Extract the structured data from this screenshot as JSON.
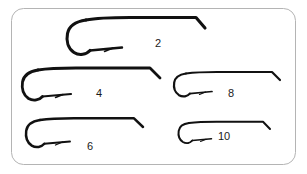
{
  "figure": {
    "type": "hook-size-chart",
    "background_color": "#ffffff",
    "panel": {
      "border_color": "#b4b4b4",
      "border_width": 1,
      "corner_radius": 12,
      "x": 11,
      "y": 8,
      "width": 285,
      "height": 157
    },
    "hook": {
      "stroke_color": "#111111",
      "description": "down-eye long-shank fly hook, bend at left, eye at right"
    },
    "hooks": [
      {
        "label": "2",
        "label_x": 155,
        "label_y": 38,
        "shank_length": 130,
        "gape": 29,
        "stroke_width": 3.0,
        "origin_x": 74,
        "origin_y": 18
      },
      {
        "label": "4",
        "label_x": 96,
        "label_y": 88,
        "shank_length": 115,
        "gape": 26,
        "stroke_width": 2.7,
        "origin_x": 25,
        "origin_y": 68
      },
      {
        "label": "8",
        "label_x": 228,
        "label_y": 88,
        "shank_length": 95,
        "gape": 21,
        "stroke_width": 2.2,
        "origin_x": 176,
        "origin_y": 72
      },
      {
        "label": "6",
        "label_x": 87,
        "label_y": 141,
        "shank_length": 100,
        "gape": 23,
        "stroke_width": 2.4,
        "origin_x": 28,
        "origin_y": 118
      },
      {
        "label": "10",
        "label_x": 218,
        "label_y": 131,
        "shank_length": 82,
        "gape": 18,
        "stroke_width": 2.0,
        "origin_x": 180,
        "origin_y": 122
      }
    ]
  }
}
